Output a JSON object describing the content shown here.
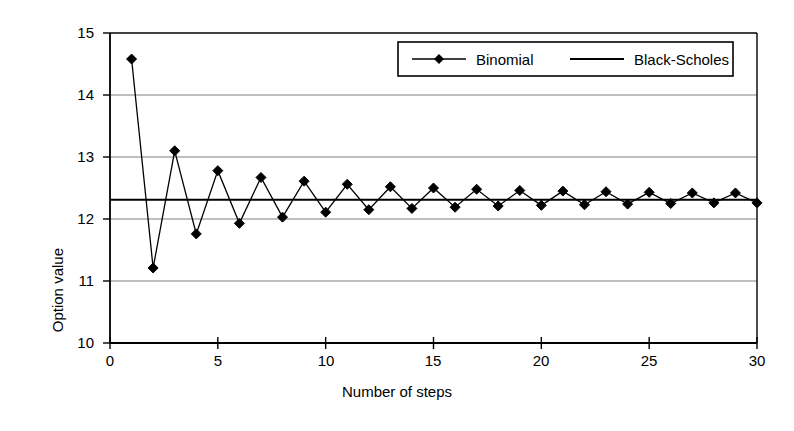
{
  "chart_data": {
    "type": "line",
    "title": "",
    "xlabel": "Number of steps",
    "ylabel": "Option value",
    "xlim": [
      0,
      30
    ],
    "ylim": [
      10,
      15
    ],
    "xticks": [
      0,
      5,
      10,
      15,
      20,
      25,
      30
    ],
    "yticks": [
      10,
      11,
      12,
      13,
      14,
      15
    ],
    "grid": "horizontal",
    "legend_position": "top-right",
    "x": [
      1,
      2,
      3,
      4,
      5,
      6,
      7,
      8,
      9,
      10,
      11,
      12,
      13,
      14,
      15,
      16,
      17,
      18,
      19,
      20,
      21,
      22,
      23,
      24,
      25,
      26,
      27,
      28,
      29,
      30
    ],
    "series": [
      {
        "name": "Binomial",
        "marker": "diamond",
        "color": "#000000",
        "values": [
          14.58,
          11.21,
          13.1,
          11.76,
          12.78,
          11.93,
          12.67,
          12.03,
          12.61,
          12.11,
          12.56,
          12.15,
          12.52,
          12.17,
          12.5,
          12.19,
          12.48,
          12.21,
          12.46,
          12.22,
          12.45,
          12.23,
          12.44,
          12.24,
          12.43,
          12.25,
          12.42,
          12.26,
          12.42,
          12.26
        ]
      },
      {
        "name": "Black-Scholes",
        "marker": "none",
        "color": "#000000",
        "constant_value": 12.31,
        "values": [
          12.31,
          12.31,
          12.31,
          12.31,
          12.31,
          12.31,
          12.31,
          12.31,
          12.31,
          12.31,
          12.31,
          12.31,
          12.31,
          12.31,
          12.31,
          12.31,
          12.31,
          12.31,
          12.31,
          12.31,
          12.31,
          12.31,
          12.31,
          12.31,
          12.31,
          12.31,
          12.31,
          12.31,
          12.31,
          12.31
        ]
      }
    ]
  },
  "axes": {
    "y_title": "Option value",
    "x_title": "Number of steps",
    "y_tick_labels": [
      "15",
      "14",
      "13",
      "12",
      "11",
      "10"
    ],
    "x_tick_labels": [
      "0",
      "5",
      "10",
      "15",
      "20",
      "25",
      "30"
    ]
  },
  "legend": {
    "entries": [
      {
        "label": "Binomial",
        "marker": "diamond-with-line"
      },
      {
        "label": "Black-Scholes",
        "marker": "line"
      }
    ]
  },
  "colors": {
    "ink": "#000000",
    "grid": "#808080",
    "background": "#ffffff"
  }
}
